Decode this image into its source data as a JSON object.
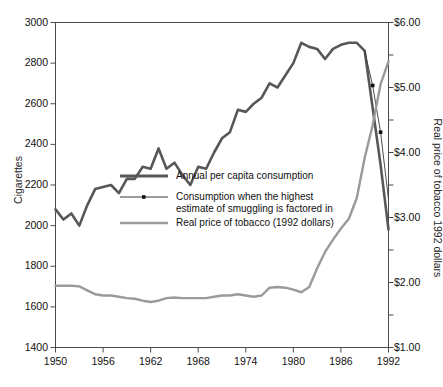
{
  "chart_data": {
    "type": "line",
    "title": "",
    "xlabel": "",
    "ylabel": "Cigarettes",
    "ylabel_right": "Real price of tobacco 1992 dollars",
    "xlim": [
      1950,
      1992
    ],
    "ylim": [
      1400,
      3000
    ],
    "ylim_right": [
      1.0,
      6.0
    ],
    "grid": false,
    "legend_position": "center-left",
    "x_ticks": [
      "1950",
      "1956",
      "1962",
      "1968",
      "1974",
      "1980",
      "1986",
      "1992"
    ],
    "x_tick_values": [
      1950,
      1956,
      1962,
      1968,
      1974,
      1980,
      1986,
      1992
    ],
    "y_ticks_left": [
      "1400",
      "1600",
      "1800",
      "2000",
      "2200",
      "2400",
      "2600",
      "2800",
      "3000"
    ],
    "y_tick_values_left": [
      1400,
      1600,
      1800,
      2000,
      2200,
      2400,
      2600,
      2800,
      3000
    ],
    "y_ticks_right": [
      "$1.00",
      "$2.00",
      "$3.00",
      "$4.00",
      "$5.00",
      "$6.00"
    ],
    "y_tick_values_right": [
      1.0,
      2.0,
      3.0,
      4.0,
      5.0,
      6.0
    ],
    "y_minor_ticks_right": [
      1.5,
      2.5,
      3.5,
      4.5,
      5.5
    ],
    "series": [
      {
        "name": "Annual per capita consumption",
        "axis": "left",
        "color": "#575757",
        "width": 2.6,
        "markers": false,
        "x": [
          1950,
          1951,
          1952,
          1953,
          1954,
          1955,
          1956,
          1957,
          1958,
          1959,
          1960,
          1961,
          1962,
          1963,
          1964,
          1965,
          1966,
          1967,
          1968,
          1969,
          1970,
          1971,
          1972,
          1973,
          1974,
          1975,
          1976,
          1977,
          1978,
          1979,
          1980,
          1981,
          1982,
          1983,
          1984,
          1985,
          1986,
          1987,
          1988,
          1989,
          1990,
          1991,
          1992
        ],
        "y": [
          2080,
          2030,
          2060,
          2000,
          2100,
          2180,
          2190,
          2200,
          2160,
          2230,
          2230,
          2290,
          2280,
          2380,
          2280,
          2310,
          2250,
          2200,
          2290,
          2280,
          2360,
          2430,
          2460,
          2570,
          2560,
          2600,
          2630,
          2700,
          2680,
          2740,
          2800,
          2900,
          2880,
          2870,
          2820,
          2870,
          2890,
          2900,
          2900,
          2860,
          2580,
          2300,
          1980
        ],
        "note": "dark thick line, left axis, cigarettes per capita"
      },
      {
        "name": "Consumption when the highest estimate of smuggling is factored in",
        "axis": "left",
        "color": "#3a3a3a",
        "width": 0.9,
        "markers": true,
        "x": [
          1989,
          1990,
          1991,
          1992
        ],
        "y": [
          2860,
          2690,
          2460,
          2130
        ],
        "marker_x": [
          1990,
          1991
        ],
        "marker_y": [
          2690,
          2460
        ],
        "note": "thin line with small square dot markers branching off near 1989-1992"
      },
      {
        "name": "Real price of tobacco (1992 dollars)",
        "axis": "right",
        "color": "#9a9a9a",
        "width": 2.4,
        "markers": false,
        "x": [
          1950,
          1951,
          1952,
          1953,
          1954,
          1955,
          1956,
          1957,
          1958,
          1959,
          1960,
          1961,
          1962,
          1963,
          1964,
          1965,
          1966,
          1967,
          1968,
          1969,
          1970,
          1971,
          1972,
          1973,
          1974,
          1975,
          1976,
          1977,
          1978,
          1979,
          1980,
          1981,
          1982,
          1983,
          1984,
          1985,
          1986,
          1987,
          1988,
          1989,
          1990,
          1991,
          1992
        ],
        "y": [
          1.95,
          1.95,
          1.95,
          1.94,
          1.88,
          1.82,
          1.8,
          1.8,
          1.78,
          1.76,
          1.75,
          1.72,
          1.7,
          1.72,
          1.76,
          1.77,
          1.76,
          1.76,
          1.76,
          1.76,
          1.78,
          1.8,
          1.8,
          1.82,
          1.8,
          1.78,
          1.8,
          1.92,
          1.93,
          1.92,
          1.89,
          1.85,
          1.93,
          2.22,
          2.47,
          2.66,
          2.83,
          2.98,
          3.3,
          3.92,
          4.42,
          5.05,
          5.4
        ],
        "note": "light gray line, right axis, dollars"
      }
    ],
    "legend": [
      {
        "label": "Annual per capita consumption",
        "style": "thick-dark-line"
      },
      {
        "label": "Consumption when the highest\nestimate of smuggling is factored in",
        "style": "thin-line-with-dot"
      },
      {
        "label": "Real price of tobacco (1992 dollars)",
        "style": "thick-light-line"
      }
    ],
    "colors": {
      "consumption": "#575757",
      "smuggling": "#3a3a3a",
      "price": "#9a9a9a",
      "axis": "#4a4a4a",
      "background": "#ffffff"
    }
  }
}
